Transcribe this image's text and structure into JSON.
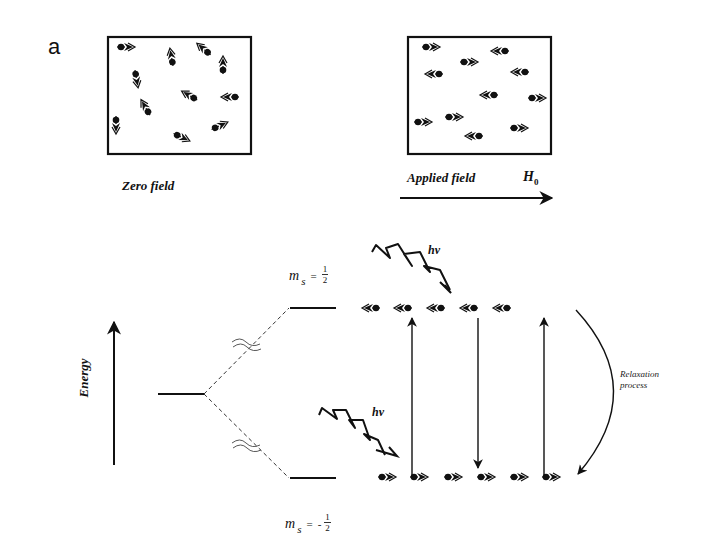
{
  "figure": {
    "panel_label": "a",
    "zero_field": {
      "caption": "Zero field",
      "box": {
        "x": 108,
        "y": 37,
        "w": 143,
        "h": 117
      },
      "spins": [
        {
          "x": 123,
          "y": 47,
          "angle": 0
        },
        {
          "x": 172,
          "y": 60,
          "angle": -100
        },
        {
          "x": 206,
          "y": 51,
          "angle": -140
        },
        {
          "x": 223,
          "y": 68,
          "angle": -90
        },
        {
          "x": 136,
          "y": 76,
          "angle": 80
        },
        {
          "x": 192,
          "y": 97,
          "angle": -150
        },
        {
          "x": 233,
          "y": 97,
          "angle": 180
        },
        {
          "x": 147,
          "y": 110,
          "angle": -120
        },
        {
          "x": 116,
          "y": 122,
          "angle": 90
        },
        {
          "x": 179,
          "y": 136,
          "angle": 25
        },
        {
          "x": 217,
          "y": 127,
          "angle": -25
        }
      ]
    },
    "applied_field": {
      "caption": "Applied field",
      "field_symbol": "H",
      "field_subscript": "0",
      "box": {
        "x": 408,
        "y": 37,
        "w": 143,
        "h": 117
      },
      "arrow": {
        "x1": 400,
        "x2": 552,
        "y": 198
      },
      "spins": [
        {
          "x": 428,
          "y": 47,
          "dir": "right"
        },
        {
          "x": 503,
          "y": 51,
          "dir": "left"
        },
        {
          "x": 466,
          "y": 62,
          "dir": "right"
        },
        {
          "x": 437,
          "y": 74,
          "dir": "left"
        },
        {
          "x": 523,
          "y": 72,
          "dir": "left"
        },
        {
          "x": 492,
          "y": 95,
          "dir": "left"
        },
        {
          "x": 534,
          "y": 98,
          "dir": "right"
        },
        {
          "x": 420,
          "y": 122,
          "dir": "right"
        },
        {
          "x": 451,
          "y": 117,
          "dir": "right"
        },
        {
          "x": 477,
          "y": 136,
          "dir": "left"
        },
        {
          "x": 516,
          "y": 128,
          "dir": "right"
        }
      ]
    },
    "energy_diagram": {
      "axis_label": "Energy",
      "upper_level_label": {
        "symbol": "m",
        "sub": "s",
        "eq": "=",
        "sign": "",
        "num": "1",
        "den": "2"
      },
      "lower_level_label": {
        "symbol": "m",
        "sub": "s",
        "eq": "=",
        "sign": "-",
        "num": "1",
        "den": "2"
      },
      "photon_label_upper": "hν",
      "photon_label_lower": "hν",
      "relaxation_label_line1": "Relaxation",
      "relaxation_label_line2": "process",
      "upper_spins": {
        "y": 308,
        "xs": [
          374,
          406,
          439,
          472,
          505
        ],
        "dir": "left"
      },
      "lower_spins": {
        "y": 477,
        "xs": [
          384,
          416,
          450,
          483,
          516,
          548
        ],
        "dir": "right"
      },
      "transitions": [
        {
          "x": 412,
          "from": 477,
          "to": 318,
          "dir": "up"
        },
        {
          "x": 478,
          "from": 318,
          "to": 468,
          "dir": "down"
        },
        {
          "x": 544,
          "from": 477,
          "to": 318,
          "dir": "up"
        }
      ]
    }
  }
}
